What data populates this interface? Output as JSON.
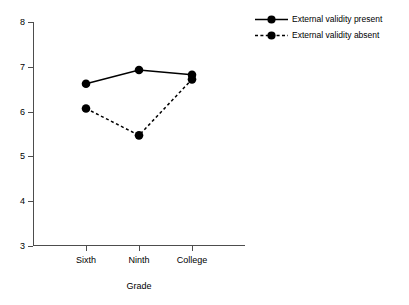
{
  "chart_data": {
    "type": "line",
    "title": "",
    "xlabel": "Grade",
    "ylabel": "",
    "categories": [
      "Sixth",
      "Ninth",
      "College"
    ],
    "ylim": [
      3,
      8
    ],
    "yticks": [
      3,
      4,
      5,
      6,
      7,
      8
    ],
    "ytick_labels": [
      "3",
      "4",
      "5",
      "6",
      "7",
      "8"
    ],
    "grid": false,
    "legend_position": "top-right",
    "series": [
      {
        "name": "External validity present",
        "values": [
          6.62,
          6.93,
          6.82
        ],
        "line_style": "solid",
        "marker": "filled-circle",
        "color": "#000000"
      },
      {
        "name": "External validity absent",
        "values": [
          6.07,
          5.47,
          6.72
        ],
        "line_style": "dashed",
        "marker": "filled-circle",
        "color": "#000000"
      }
    ]
  },
  "axis": {
    "x_title": "Grade",
    "x_tick_labels": [
      "Sixth",
      "Ninth",
      "College"
    ],
    "y_tick_labels": [
      "3",
      "4",
      "5",
      "6",
      "7",
      "8"
    ]
  },
  "legend": {
    "entries": [
      {
        "label": "External validity present",
        "style": "solid"
      },
      {
        "label": "External validity absent",
        "style": "dashed"
      }
    ]
  }
}
